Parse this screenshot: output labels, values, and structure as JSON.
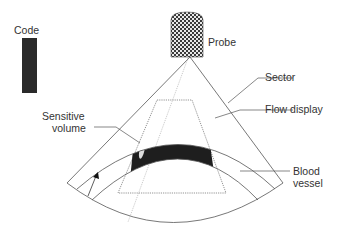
{
  "diagram": {
    "labels": {
      "code": "Code",
      "probe": "Probe",
      "sector": "Sector",
      "flow_display": "Flow display",
      "sensitive_volume_line1": "Sensitive",
      "sensitive_volume_line2": "volume",
      "blood_vessel_line1": "Blood",
      "blood_vessel_line2": "vessel"
    },
    "colors": {
      "line": "#555555",
      "text": "#333333",
      "code_bar": "#2a2a2a",
      "vessel_band": "#1e1e1e",
      "probe_checker_dark": "#3a3a3a",
      "probe_checker_light": "#e8e8e8",
      "dotted_line": "#9a9a9a"
    }
  }
}
